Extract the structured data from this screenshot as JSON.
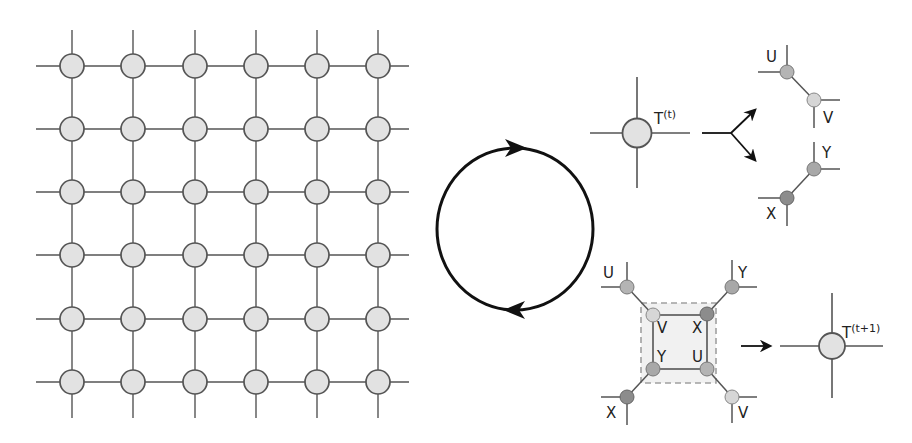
{
  "diagram": {
    "colors": {
      "line": "#555555",
      "node_stroke": "#555555",
      "node_fill": "#e2e2e2",
      "fill_U": "#b4b4b4",
      "fill_V": "#d6d6d6",
      "fill_X": "#8c8c8c",
      "fill_Y": "#a8a8a8",
      "cycle": "#111111",
      "dash": "#a0a0a0",
      "plaquette_fill": "#f1f1f1"
    },
    "lattice": {
      "rows": 6,
      "cols": 6,
      "xs": [
        72,
        133,
        195,
        256,
        317,
        378
      ],
      "ys": [
        66,
        129,
        192,
        255,
        319,
        382
      ],
      "node_radius": 12
    },
    "cycle": {
      "cx": 515,
      "cy": 229,
      "rx": 78,
      "ry": 81
    },
    "tensor_t": {
      "base": "T",
      "superscript": "(t)"
    },
    "tensor_t1": {
      "base": "T",
      "superscript": "(t+1)"
    },
    "decomposition": {
      "upper_pair": {
        "a": "U",
        "b": "V"
      },
      "lower_pair": {
        "a": "Y",
        "b": "X"
      }
    },
    "plaquette": {
      "outer": {
        "top_left": "U",
        "top_right": "Y",
        "bottom_left": "X",
        "bottom_right": "V"
      },
      "inner": {
        "top_left": "V",
        "top_right": "X",
        "bottom_left": "Y",
        "bottom_right": "U"
      }
    }
  }
}
